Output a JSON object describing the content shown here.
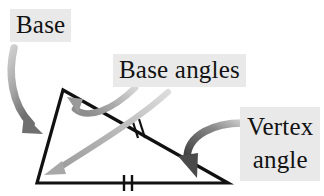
{
  "figure": {
    "type": "geometry-diagram",
    "background_color": "#ffffff",
    "label_highlight_color": "#e9e9e9",
    "text_color": "#121212",
    "stroke_color_triangle": "#111111",
    "stroke_color_arrow_gray": "#9a9a9a",
    "stroke_color_arrow_dark": "#555555"
  },
  "labels": {
    "base": "Base",
    "base_angles": "Base angles",
    "vertex_angle_line1": "Vertex",
    "vertex_angle_line2": "angle"
  },
  "geometry": {
    "apex": [
      63,
      90
    ],
    "bottom_left": [
      37,
      183
    ],
    "bottom_right": [
      228,
      183
    ],
    "base_tick_marks": 2,
    "leg_tick_marks": 2,
    "tick_position_base": [
      127,
      183
    ],
    "tick_position_leg": [
      138,
      130
    ]
  },
  "annotations": [
    {
      "name": "base-arrow",
      "from_label": "Base",
      "points_to": "left side of triangle",
      "arrow_tip": [
        40,
        132
      ],
      "color": "#8c8c8c"
    },
    {
      "name": "base-angle-arrow-apex",
      "from_label": "Base angles",
      "points_to": "apex angle interior",
      "arrow_tip": [
        68,
        100
      ],
      "color": "#9e9e9e"
    },
    {
      "name": "base-angle-arrow-left",
      "from_label": "Base angles",
      "points_to": "bottom-left angle interior",
      "arrow_tip": [
        44,
        176
      ],
      "color": "#b0b0b0"
    },
    {
      "name": "vertex-angle-arrow",
      "from_label": "Vertex angle",
      "points_to": "bottom-right angle interior",
      "arrow_tip": [
        203,
        178
      ],
      "color": "#5a5a5a"
    }
  ]
}
